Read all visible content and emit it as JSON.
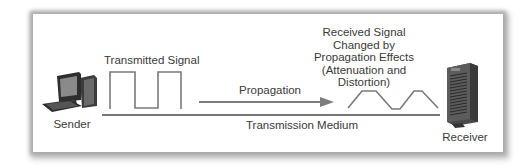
{
  "diagram": {
    "sender": {
      "label": "Sender",
      "icon": "desktop-computer-icon"
    },
    "receiver": {
      "label": "Receiver",
      "icon": "server-tower-icon"
    },
    "transmitted_signal": {
      "label": "Transmitted Signal",
      "waveform": "square"
    },
    "propagation": {
      "label": "Propagation",
      "direction": "left-to-right"
    },
    "medium": {
      "label": "Transmission Medium"
    },
    "received_signal": {
      "lines": [
        "Received Signal",
        "Changed by",
        "Propagation Effects",
        "(Attenuation and",
        "Distortion)"
      ],
      "waveform": "trapezoidal"
    },
    "colors": {
      "line": "#4a4a4a",
      "wave": "#7a7a7a",
      "arrow": "#7d7d7d",
      "text": "#3a3a3a",
      "card_shadow": "#a9a9a9"
    }
  }
}
